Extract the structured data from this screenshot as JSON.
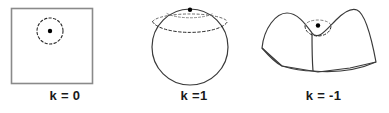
{
  "figure": {
    "background_color": "#ffffff",
    "stroke_color": "#3a3a3a",
    "square_stroke_color": "#8a8a8a",
    "dot_color": "#000000",
    "label_color": "#1a1a1a"
  },
  "panels": [
    {
      "id": "flat",
      "label": "k = 0",
      "geometry_name": "flat-plane-square",
      "description": "Square representing flat Euclidean space with a dashed circle and a center point",
      "curvature_value": 0,
      "marker": {
        "center_x": 50,
        "center_y": 31,
        "radius": 13,
        "style": "dashed"
      }
    },
    {
      "id": "sphere",
      "label": "k =1",
      "geometry_name": "sphere",
      "description": "Sphere representing positively curved closed space with a dashed latitude circle near the pole and a point at the pole",
      "curvature_value": 1,
      "marker": {
        "center_x": 190,
        "center_y": 10,
        "radius": 13,
        "style": "dashed"
      }
    },
    {
      "id": "saddle",
      "label": "k = -1",
      "geometry_name": "saddle-hyperboloid",
      "description": "Saddle surface representing negatively curved open space with a dashed circle and a center point",
      "curvature_value": -1,
      "marker": {
        "center_x": 318,
        "center_y": 27,
        "radius": 13,
        "style": "dashed"
      }
    }
  ]
}
